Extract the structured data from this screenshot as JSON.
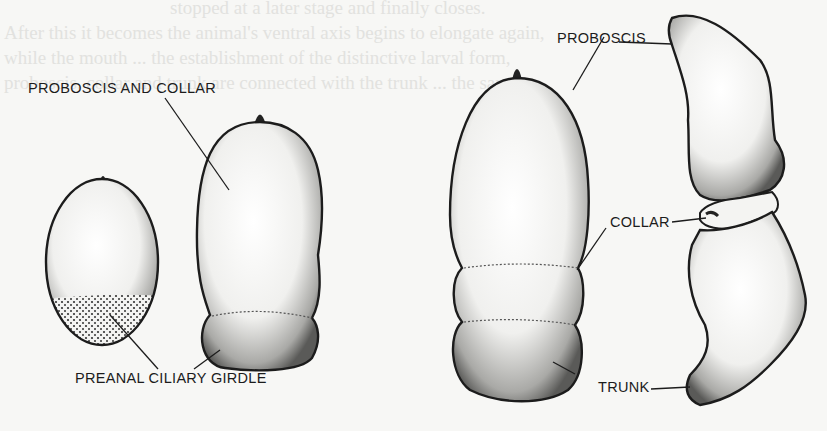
{
  "background_bleed_text": [
    "stopped at a later stage and finally closes.",
    "After this it becomes the animal's ventral axis begins to elongate again,",
    "while the mouth ... the establishment of the distinctive larval form,",
    "proboscis, collar and trunk are connected with the trunk ... the same"
  ],
  "figure": {
    "stages": [
      {
        "id": "stage-1",
        "description": "ovoid larva with apical tuft and stippled posterior band"
      },
      {
        "id": "stage-2",
        "description": "elongated larva with constriction"
      },
      {
        "id": "stage-3",
        "description": "three-segmented larva"
      },
      {
        "id": "stage-4",
        "description": "juvenile worm, lateral view"
      }
    ],
    "labels": {
      "proboscis_and_collar": "PROBOSCIS AND COLLAR",
      "preanal_ciliary_girdle": "PREANAL CILIARY GIRDLE",
      "proboscis": "PROBOSCIS",
      "collar": "COLLAR",
      "trunk": "TRUNK"
    }
  },
  "colors": {
    "ink": "#1c1c1c",
    "paper": "#f7f7f5",
    "bleed": "#e2e2df"
  }
}
